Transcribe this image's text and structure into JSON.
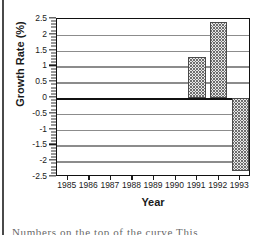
{
  "figure": {
    "kind": "bar-chart",
    "frame_color": "#111111",
    "grid_color": "#8c8c8c",
    "bar_fill": "#e8e8e8",
    "bar_edge": "#4a4a4a"
  },
  "axes": {
    "ylabel": "Growth Rate (%)",
    "xlabel": "Year",
    "ytick_labels": [
      "2.5",
      "2",
      "1.5",
      "1",
      "0.5",
      "0",
      "-0.5",
      "-1",
      "-1.5",
      "-2",
      "-2.5"
    ],
    "xtick_labels": [
      "1985",
      "1986",
      "1987",
      "1988",
      "1989",
      "1990",
      "1991",
      "1992",
      "1993"
    ]
  },
  "caption": {
    "clipped_line": "Numbers on the  top of the  curve     This"
  },
  "chart_data": {
    "type": "bar",
    "title": "",
    "xlabel": "Year",
    "ylabel": "Growth Rate (%)",
    "categories": [
      "1985",
      "1986",
      "1987",
      "1988",
      "1989",
      "1990",
      "1991",
      "1992",
      "1993"
    ],
    "values": [
      null,
      null,
      null,
      null,
      null,
      null,
      1.3,
      2.4,
      -2.3
    ],
    "ylim": [
      -2.5,
      2.5
    ],
    "ytick_values": [
      2.5,
      2,
      1.5,
      1,
      0.5,
      0,
      -0.5,
      -1,
      -1.5,
      -2,
      -2.5
    ],
    "yminor_step": 0.1,
    "grid": "horizontal",
    "legend": "none",
    "zero_line": 0
  }
}
